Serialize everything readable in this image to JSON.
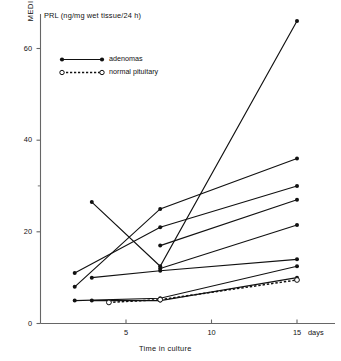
{
  "chart_data": {
    "type": "line",
    "title": "PRL (ng/mg wet tissue/24 h)",
    "xlabel": "Time in culture",
    "ylabel": "MEDIUM",
    "x_unit_label": "days",
    "xlim": [
      0,
      16
    ],
    "ylim": [
      0,
      63
    ],
    "xticks": [
      5,
      10,
      15
    ],
    "yticks": [
      0,
      20,
      40,
      60
    ],
    "grid": false,
    "legend_position": "top-left",
    "legend": [
      {
        "name": "adenomas",
        "marker": "filled-circle",
        "line": "solid"
      },
      {
        "name": "normal pituitary",
        "marker": "open-circle",
        "line": "dashed"
      }
    ],
    "series": [
      {
        "name": "adenomas",
        "marker": "filled-circle",
        "line": "solid",
        "points": [
          [
            3,
            26.5
          ],
          [
            7,
            12.5
          ],
          [
            15,
            66.0
          ]
        ]
      },
      {
        "name": "adenomas",
        "marker": "filled-circle",
        "line": "solid",
        "points": [
          [
            2,
            8.0
          ],
          [
            7,
            25.0
          ],
          [
            15,
            36.0
          ]
        ]
      },
      {
        "name": "adenomas",
        "marker": "filled-circle",
        "line": "solid",
        "points": [
          [
            2,
            11.0
          ],
          [
            7,
            21.0
          ],
          [
            15,
            30.0
          ]
        ]
      },
      {
        "name": "adenomas",
        "marker": "filled-circle",
        "line": "solid",
        "points": [
          [
            7,
            17.0
          ],
          [
            15,
            27.0
          ]
        ]
      },
      {
        "name": "adenomas",
        "marker": "filled-circle",
        "line": "solid",
        "points": [
          [
            7,
            12.0
          ],
          [
            15,
            21.5
          ]
        ]
      },
      {
        "name": "adenomas",
        "marker": "filled-circle",
        "line": "solid",
        "points": [
          [
            3,
            10.0
          ],
          [
            7,
            11.5
          ],
          [
            15,
            14.0
          ]
        ]
      },
      {
        "name": "adenomas",
        "marker": "filled-circle",
        "line": "solid",
        "points": [
          [
            2,
            5.0
          ],
          [
            7,
            5.5
          ],
          [
            15,
            12.5
          ]
        ]
      },
      {
        "name": "adenomas",
        "marker": "filled-circle",
        "line": "solid",
        "points": [
          [
            3,
            5.0
          ],
          [
            7,
            5.0
          ],
          [
            15,
            10.0
          ]
        ]
      },
      {
        "name": "normal pituitary",
        "marker": "open-circle",
        "line": "dashed",
        "points": [
          [
            4,
            4.6
          ],
          [
            7,
            5.2
          ],
          [
            15,
            9.5
          ]
        ]
      }
    ]
  },
  "legend_items": [
    {
      "label": "adenomas"
    },
    {
      "label": "normal pituitary"
    }
  ],
  "axis": {
    "title": "PRL (ng/mg wet tissue/24 h)",
    "x_title": "Time in culture",
    "y_title": "MEDIUM",
    "x_unit": "days",
    "y_tick_0": "0",
    "y_tick_20": "20",
    "y_tick_40": "40",
    "y_tick_60": "60",
    "x_tick_5": "5",
    "x_tick_10": "10",
    "x_tick_15": "15"
  },
  "colors": {
    "ink": "#111111",
    "axis": "#555555",
    "background": "#ffffff"
  }
}
